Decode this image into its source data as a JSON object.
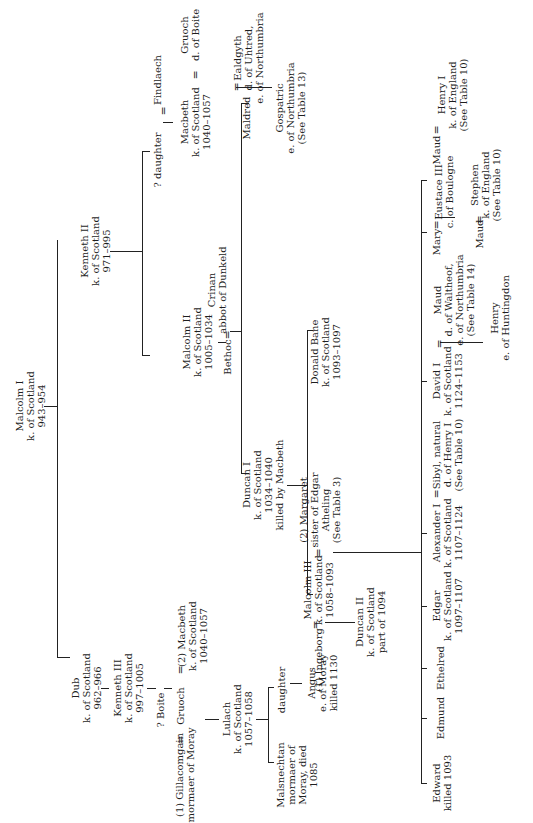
{
  "diagram": {
    "type": "genealogical-table",
    "orientation": "rotated-90-ccw",
    "line_color": "#222222",
    "background": "#ffffff"
  },
  "people": {
    "malcolm_i": [
      "Malcolm I",
      "k. of Scotland",
      "943–954"
    ],
    "dub": [
      "Dub",
      "k. of Scotland",
      "962–966"
    ],
    "kenneth_iii": [
      "Kenneth III",
      "k. of Scotland",
      "997–1005"
    ],
    "boite": [
      "? Boite"
    ],
    "kenneth_ii": [
      "Kenneth II",
      "k. of Scotland",
      "971–995"
    ],
    "daughter_findlaech_wife": [
      "? daughter"
    ],
    "findlaech": [
      "Findlaech"
    ],
    "macbeth_top": [
      "Macbeth",
      "k. of Scotland",
      "1040–1057"
    ],
    "gruoch_top": [
      "Gruoch",
      "d. of Boite"
    ],
    "malcolm_ii": [
      "Malcolm II",
      "k. of Scotland",
      "1005–1034"
    ],
    "bethoc": [
      "Bethoc"
    ],
    "crinan": [
      "Crinan",
      "abbot of Dunkeld"
    ],
    "maldred": [
      "Maldred"
    ],
    "ealdgyth": [
      "Ealdgyth",
      "d. of Uhtred,",
      "e. of Northumbria"
    ],
    "gospatric": [
      "Gospatric",
      "e. of Northumbria",
      "(See Table 13)"
    ],
    "gillacomgain": [
      "(1) Gillacomgain",
      "mormaer of Moray"
    ],
    "gruoch": [
      "Gruoch"
    ],
    "macbeth_2": [
      "(2) Macbeth",
      "k. of Scotland",
      "1040–1057"
    ],
    "lulach": [
      "Lulach",
      "k. of Scotland",
      "1057–1058"
    ],
    "malsnechtan": [
      "Malsnechtan",
      "mormaer of",
      "Moray, died",
      "1085"
    ],
    "daughter_lulach": [
      "daughter"
    ],
    "angus": [
      "Angus",
      "e. of Moray",
      "killed 1130"
    ],
    "duncan_i": [
      "Duncan I",
      "k. of Scotland",
      "1034–1040",
      "killed by Macbeth"
    ],
    "ingeborg": [
      "(1) Ingeborg"
    ],
    "malcolm_iii": [
      "Malcolm III",
      "k. of Scotland",
      "1058–1093"
    ],
    "margaret": [
      "(2) Margaret",
      "sister of Edgar",
      "Atheling",
      "(See Table 3)"
    ],
    "donald_bane": [
      "Donald Bane",
      "k. of Scotland",
      "1093–1097"
    ],
    "duncan_ii": [
      "Duncan II",
      "k. of Scotland",
      "part of 1094"
    ],
    "edward": [
      "Edward",
      "killed 1093"
    ],
    "edmund": [
      "Edmund"
    ],
    "ethelred": [
      "Ethelred"
    ],
    "edgar": [
      "Edgar",
      "k. of Scotland",
      "1097–1107"
    ],
    "alexander_i": [
      "Alexander I",
      "k. of Scotland",
      "1107–1124"
    ],
    "sibyl": [
      "Sibyl, natural",
      "d. of Henry I",
      "(See Table 10)"
    ],
    "david_i": [
      "David I",
      "k. of Scotland",
      "1124–1153"
    ],
    "maud_waltheof": [
      "Maud",
      "d. of Waltheof,",
      "e. of Northumbria",
      "(See Table 14)"
    ],
    "henry_huntingdon": [
      "Henry",
      "e. of Huntingdon"
    ],
    "mary": [
      "Mary"
    ],
    "eustace_iii": [
      "Eustace III",
      "c. of Boulogne"
    ],
    "maud_boulogne": [
      "Maud"
    ],
    "stephen": [
      "Stephen",
      "k. of England",
      "(See Table 10)"
    ],
    "maud_henry": [
      "Maud"
    ],
    "henry_i": [
      "Henry I",
      "k. of England",
      "(See Table 10)"
    ]
  },
  "marriage_symbol": "="
}
